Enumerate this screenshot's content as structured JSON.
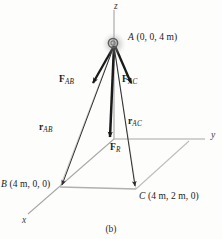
{
  "figure": {
    "caption": "(b)",
    "type": "3d-force-vector-diagram",
    "axes": [
      {
        "name": "z",
        "label": "z",
        "x": 117,
        "y": 5
      },
      {
        "name": "y",
        "label": "y",
        "x": 211,
        "y": 138
      },
      {
        "name": "x",
        "label": "x",
        "x": 23,
        "y": 222
      }
    ],
    "points": [
      {
        "name": "A",
        "label": "A",
        "coords": "(0, 0, 4 m)",
        "px": 114,
        "py": 45,
        "label_x": 129,
        "label_y": 38
      },
      {
        "name": "B",
        "label": "B",
        "coords": "(4 m, 0, 0)",
        "px": 60,
        "py": 187,
        "label_x": 2,
        "label_y": 182
      },
      {
        "name": "C",
        "label": "C",
        "coords": "(4 m, 2 m, 0)",
        "px": 136,
        "py": 189,
        "label_x": 139,
        "label_y": 194
      }
    ],
    "vectors": [
      {
        "name": "F_AB",
        "label": "F",
        "sub": "AB",
        "kind": "force",
        "label_x": 62,
        "label_y": 80
      },
      {
        "name": "F_AC",
        "label": "F",
        "sub": "AC",
        "kind": "force",
        "label_x": 122,
        "label_y": 80
      },
      {
        "name": "F_R",
        "label": "F",
        "sub": "R",
        "kind": "resultant-force",
        "label_x": 110,
        "label_y": 148
      },
      {
        "name": "r_AB",
        "label": "r",
        "sub": "AB",
        "kind": "position",
        "label_x": 41,
        "label_y": 128
      },
      {
        "name": "r_AC",
        "label": "r",
        "sub": "AC",
        "kind": "position",
        "label_x": 129,
        "label_y": 122
      }
    ],
    "colors": {
      "axis": "#9a9a9a",
      "plane": "#b4b4b4",
      "force": "#1a1a1a",
      "position": "#2e2e2e",
      "text": "#1b1b1b",
      "node": "#7a7a7a",
      "background": "#fdfdfc"
    }
  }
}
